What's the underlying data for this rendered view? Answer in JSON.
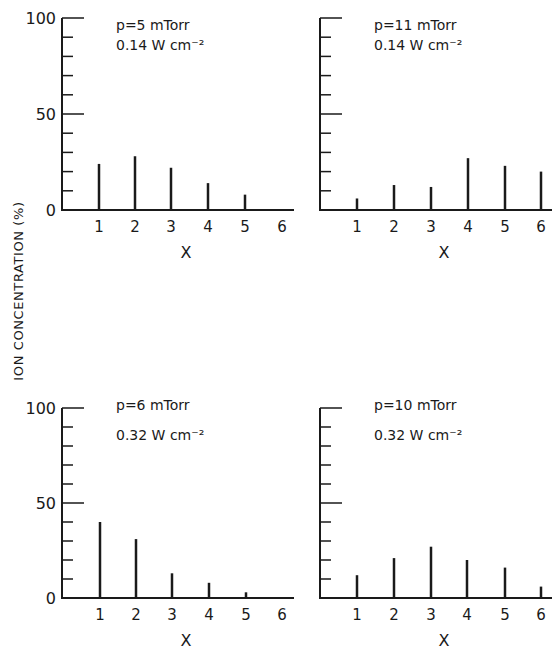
{
  "figure": {
    "ylabel": "ION CONCENTRATION (%)",
    "xlabel": "X"
  },
  "chart_data": [
    {
      "type": "bar",
      "panel": "top-left",
      "annotation": [
        "p=5 mTorr",
        "0.14 W cm⁻²"
      ],
      "pressure_mTorr": 5,
      "power_density_W_cm2": 0.14,
      "categories": [
        1,
        2,
        3,
        4,
        5,
        6
      ],
      "values": [
        24,
        28,
        22,
        14,
        8,
        0
      ],
      "xlabel": "X",
      "ylabel": "ION CONCENTRATION (%)",
      "ylim": [
        0,
        100
      ],
      "yticks_labeled": [
        0,
        50,
        100
      ],
      "yticks_minor_step": 10,
      "grid": false
    },
    {
      "type": "bar",
      "panel": "top-right",
      "annotation": [
        "p=11 mTorr",
        "0.14 W cm⁻²"
      ],
      "pressure_mTorr": 11,
      "power_density_W_cm2": 0.14,
      "categories": [
        1,
        2,
        3,
        4,
        5,
        6
      ],
      "values": [
        6,
        13,
        12,
        27,
        23,
        20
      ],
      "xlabel": "X",
      "ylabel": "ION CONCENTRATION (%)",
      "ylim": [
        0,
        100
      ],
      "yticks_labeled": [],
      "yticks_minor_step": 10,
      "grid": false
    },
    {
      "type": "bar",
      "panel": "bottom-left",
      "annotation": [
        "p=6 mTorr",
        "0.32 W cm⁻²"
      ],
      "pressure_mTorr": 6,
      "power_density_W_cm2": 0.32,
      "categories": [
        1,
        2,
        3,
        4,
        5,
        6
      ],
      "values": [
        40,
        31,
        13,
        8,
        3,
        0
      ],
      "xlabel": "X",
      "ylabel": "ION CONCENTRATION (%)",
      "ylim": [
        0,
        100
      ],
      "yticks_labeled": [
        0,
        50,
        100
      ],
      "yticks_minor_step": 10,
      "grid": false
    },
    {
      "type": "bar",
      "panel": "bottom-right",
      "annotation": [
        "p=10 mTorr",
        "0.32 W cm⁻²"
      ],
      "pressure_mTorr": 10,
      "power_density_W_cm2": 0.32,
      "categories": [
        1,
        2,
        3,
        4,
        5,
        6
      ],
      "values": [
        12,
        21,
        27,
        20,
        16,
        6
      ],
      "xlabel": "X",
      "ylabel": "ION CONCENTRATION (%)",
      "ylim": [
        0,
        100
      ],
      "yticks_labeled": [],
      "yticks_minor_step": 10,
      "grid": false
    }
  ],
  "layout": {
    "panels": [
      {
        "axis_x": 62,
        "top_y": 18,
        "base_y": 210,
        "end_x": 294,
        "bar_x": [
          99,
          135,
          171,
          208,
          245,
          282
        ],
        "annot_x": 116,
        "annot_y": [
          30,
          50
        ]
      },
      {
        "axis_x": 320,
        "top_y": 18,
        "base_y": 210,
        "end_x": 552,
        "bar_x": [
          357,
          394,
          431,
          468,
          505,
          541
        ],
        "annot_x": 374,
        "annot_y": [
          30,
          50
        ]
      },
      {
        "axis_x": 62,
        "top_y": 408,
        "base_y": 598,
        "end_x": 294,
        "bar_x": [
          100,
          136,
          172,
          209,
          246,
          282
        ],
        "annot_x": 116,
        "annot_y": [
          410,
          440
        ]
      },
      {
        "axis_x": 320,
        "top_y": 408,
        "base_y": 598,
        "end_x": 552,
        "bar_x": [
          357,
          394,
          431,
          467,
          505,
          541
        ],
        "annot_x": 374,
        "annot_y": [
          410,
          440
        ]
      }
    ]
  }
}
